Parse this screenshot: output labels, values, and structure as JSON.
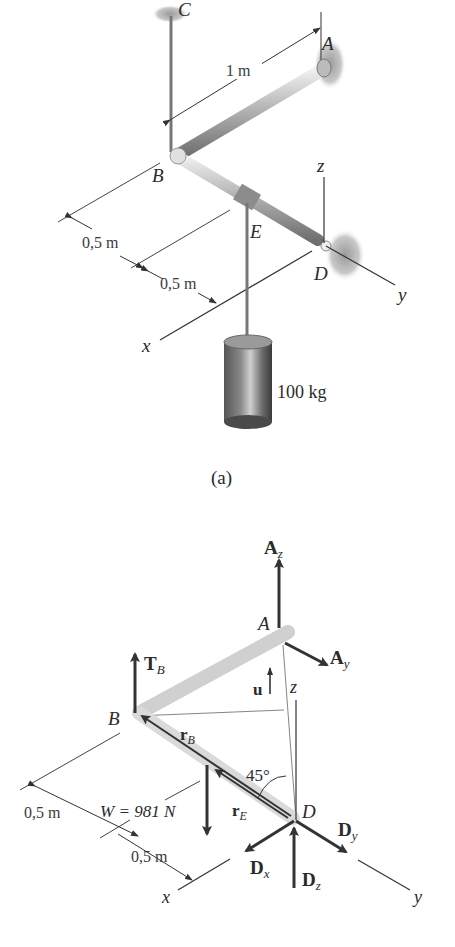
{
  "figure_a": {
    "caption": "(a)",
    "points": {
      "A": "A",
      "B": "B",
      "C": "C",
      "D": "D",
      "E": "E"
    },
    "axes": {
      "x": "x",
      "y": "y",
      "z": "z"
    },
    "dimensions": {
      "AB": "1 m",
      "BE": "0,5 m",
      "ED": "0,5 m"
    },
    "mass_label": "100 kg"
  },
  "figure_b": {
    "points": {
      "A": "A",
      "B": "B",
      "D": "D"
    },
    "axes": {
      "x": "x",
      "y": "y",
      "z": "z"
    },
    "forces": {
      "Az": {
        "main": "A",
        "sub": "z"
      },
      "Ay": {
        "main": "A",
        "sub": "y"
      },
      "TB": {
        "main": "T",
        "sub": "B"
      },
      "Dx": {
        "main": "D",
        "sub": "x"
      },
      "Dy": {
        "main": "D",
        "sub": "y"
      },
      "Dz": {
        "main": "D",
        "sub": "z"
      }
    },
    "vectors": {
      "u": "u",
      "rB": {
        "main": "r",
        "sub": "B"
      },
      "rE": {
        "main": "r",
        "sub": "E"
      }
    },
    "weight_label": "W = 981 N",
    "angle_label": "45°",
    "dimensions": {
      "BE": "0,5 m",
      "ED": "0,5 m"
    }
  },
  "colors": {
    "ink": "#2a2a2a",
    "rod_light": "#d8d8d8",
    "rod_dark": "#8a8a8a",
    "arrow": "#333333"
  }
}
